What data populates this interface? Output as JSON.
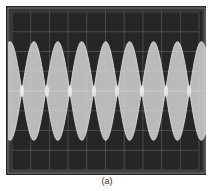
{
  "figure": {
    "caption": "(a)"
  },
  "colors": {
    "screen_background": "#262626",
    "trace": "#cfcfcf",
    "grid": "#7a7a7a",
    "bezel": "#bdbdbd"
  },
  "chart_data": {
    "type": "line",
    "title": "",
    "subtitle": "Oscilloscope trace: amplitude-modulated (beat) waveform",
    "xlabel": "",
    "ylabel": "",
    "grid": true,
    "grid_divisions": {
      "x": 10,
      "y": 8
    },
    "xlim": [
      0,
      10
    ],
    "ylim": [
      -4,
      4
    ],
    "legend": "none",
    "envelope": {
      "kind": "full-modulation beat (|cos|)",
      "peak_amplitude_div": 2.5,
      "center_div": 0,
      "null_positions_div": [
        0.53,
        1.87,
        3.1,
        4.39,
        5.61,
        6.95,
        8.24,
        9.47
      ],
      "lobe_period_div": 1.28
    },
    "series": [
      {
        "name": "upper-envelope",
        "description": "peaks at +2.5 div, nulls at 0"
      },
      {
        "name": "lower-envelope",
        "description": "peaks at -2.5 div, nulls at 0"
      }
    ]
  }
}
